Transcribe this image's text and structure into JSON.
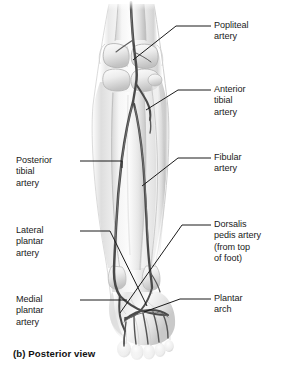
{
  "figure": {
    "caption": "(b) Posterior view",
    "view": "Posterior view",
    "part_letter": "(b)",
    "illustration_style": "grayscale anatomical drawing"
  },
  "colors": {
    "background": "#ffffff",
    "text": "#1a1a1a",
    "leader_line": "#1a1a1a",
    "vessel_dark": "#4a4a4a",
    "vessel_mid": "#6b6b6b",
    "limb_light": "#f2f2f2",
    "limb_shadow": "#b9b9b9",
    "limb_outline": "#cfcfcf",
    "bone_highlight": "#fafafa"
  },
  "labels": {
    "right": [
      {
        "id": "popliteal",
        "name": "popliteal-artery",
        "text": "Popliteal\nartery",
        "lines": [
          "Popliteal",
          "artery"
        ],
        "leader_from": [
          213,
          26
        ],
        "leader_to": [
          133,
          60
        ]
      },
      {
        "id": "anterior_tibial",
        "name": "anterior-tibial-artery",
        "text": "Anterior\ntibial\nartery",
        "lines": [
          "Anterior",
          "tibial",
          "artery"
        ],
        "leader_from": [
          213,
          90
        ],
        "leader_to": [
          146,
          110
        ]
      },
      {
        "id": "fibular",
        "name": "fibular-artery",
        "text": "Fibular\nartery",
        "lines": [
          "Fibular",
          "artery"
        ],
        "leader_from": [
          213,
          158
        ],
        "leader_to": [
          142,
          186
        ]
      },
      {
        "id": "dorsalis_pedis",
        "name": "dorsalis-pedis-artery",
        "text": "Dorsalis\npedis artery\n(from top\nof foot)",
        "lines": [
          "Dorsalis",
          "pedis artery",
          "(from top",
          "of foot)"
        ],
        "leader_from": [
          213,
          225
        ],
        "leader_to": [
          120,
          312
        ]
      },
      {
        "id": "plantar_arch",
        "name": "plantar-arch",
        "text": "Plantar\narch",
        "lines": [
          "Plantar",
          "arch"
        ],
        "leader_from": [
          213,
          299
        ],
        "leader_to": [
          143,
          311
        ]
      }
    ],
    "left": [
      {
        "id": "posterior_tibial",
        "name": "posterior-tibial-artery",
        "text": "Posterior\ntibial\nartery",
        "lines": [
          "Posterior",
          "tibial",
          "artery"
        ],
        "leader_from": [
          79,
          161
        ],
        "leader_to": [
          120,
          170
        ]
      },
      {
        "id": "lateral_plantar",
        "name": "lateral-plantar-artery",
        "text": "Lateral\nplantar\nartery",
        "lines": [
          "Lateral",
          "plantar",
          "artery"
        ],
        "leader_from": [
          79,
          231
        ],
        "leader_to": [
          146,
          305
        ]
      },
      {
        "id": "medial_plantar",
        "name": "medial-plantar-artery",
        "text": "Medial\nplantar\nartery",
        "lines": [
          "Medial",
          "plantar",
          "artery"
        ],
        "leader_from": [
          79,
          300
        ],
        "leader_to": [
          128,
          300
        ]
      }
    ]
  },
  "anatomy": {
    "structures": [
      "femur distal end",
      "femoral condyles",
      "tibial plateau",
      "tibia",
      "fibula",
      "medial malleolus",
      "lateral malleolus",
      "tarsals",
      "metatarsals",
      "phalanges"
    ],
    "vessels": [
      "popliteal artery",
      "anterior tibial artery",
      "posterior tibial artery",
      "fibular artery",
      "dorsalis pedis artery",
      "lateral plantar artery",
      "medial plantar artery",
      "plantar arch",
      "plantar digital arteries"
    ]
  }
}
